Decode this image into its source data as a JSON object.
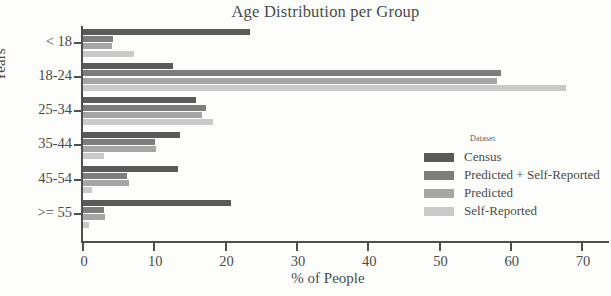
{
  "chart_data": {
    "type": "bar",
    "orientation": "horizontal",
    "title": "Age Distribution per Group",
    "xlabel": "% of People",
    "ylabel": "Years",
    "categories": [
      "< 18",
      "18-24",
      "25-34",
      "35-44",
      "45-54",
      ">= 55"
    ],
    "xlim": [
      0,
      70
    ],
    "xticks": [
      0,
      10,
      20,
      30,
      40,
      50,
      60,
      70
    ],
    "xtick_labels": [
      "0",
      "10",
      "20",
      "30",
      "40",
      "50",
      "60",
      "70"
    ],
    "grid": false,
    "legend_position": "right-inside",
    "legend_title": "Dataset",
    "series": [
      {
        "name": "Census",
        "color": "#5a5a5a",
        "values": [
          23.4,
          12.6,
          15.8,
          13.6,
          13.3,
          20.7
        ]
      },
      {
        "name": "Predicted + Self-Reported",
        "color": "#7d7d7d",
        "values": [
          4.2,
          58.6,
          17.2,
          10.1,
          6.2,
          2.9
        ]
      },
      {
        "name": "Predicted",
        "color": "#a5a5a5",
        "values": [
          4.1,
          58.0,
          16.7,
          10.3,
          6.5,
          3.1
        ]
      },
      {
        "name": "Self-Reported",
        "color": "#c9c9c9",
        "values": [
          7.2,
          67.8,
          18.2,
          2.9,
          1.3,
          0.8
        ]
      }
    ]
  }
}
